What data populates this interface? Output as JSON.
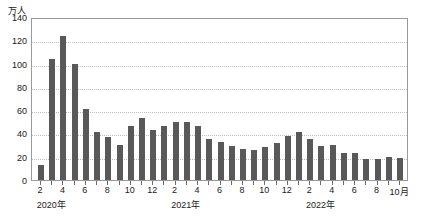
{
  "chart_data": {
    "type": "bar",
    "title": "",
    "subtitle": "",
    "unit_label": "万人",
    "xlabel": "",
    "ylabel": "",
    "ylim": [
      0,
      140
    ],
    "ytick_values": [
      0,
      20,
      40,
      60,
      80,
      100,
      120,
      140
    ],
    "ytick_labels": [
      "0",
      "20",
      "40",
      "60",
      "80",
      "100",
      "120",
      "140"
    ],
    "grid": true,
    "grid_axis": "y",
    "legend": false,
    "legend_position": "none",
    "bar_color": "#595959",
    "axis_color": "#9a9a9a",
    "grid_color": "#bdbdbd",
    "categories": [
      "2020-02",
      "2020-03",
      "2020-04",
      "2020-05",
      "2020-06",
      "2020-07",
      "2020-08",
      "2020-09",
      "2020-10",
      "2020-11",
      "2020-12",
      "2021-01",
      "2021-02",
      "2021-03",
      "2021-04",
      "2021-05",
      "2021-06",
      "2021-07",
      "2021-08",
      "2021-09",
      "2021-10",
      "2021-11",
      "2021-12",
      "2022-01",
      "2022-02",
      "2022-03",
      "2022-04",
      "2022-05",
      "2022-06",
      "2022-07",
      "2022-08",
      "2022-09",
      "2022-10"
    ],
    "values": [
      13,
      104,
      124,
      100,
      61,
      41,
      37,
      30,
      46,
      53,
      43,
      46,
      50,
      50,
      46,
      35,
      33,
      29,
      27,
      26,
      28,
      32,
      38,
      41,
      35,
      29,
      30,
      23,
      23,
      18,
      18,
      20,
      19
    ],
    "x_tick_labels": [
      {
        "index": 0,
        "label": "2"
      },
      {
        "index": 2,
        "label": "4"
      },
      {
        "index": 4,
        "label": "6"
      },
      {
        "index": 6,
        "label": "8"
      },
      {
        "index": 8,
        "label": "10"
      },
      {
        "index": 10,
        "label": "12"
      },
      {
        "index": 12,
        "label": "2"
      },
      {
        "index": 14,
        "label": "4"
      },
      {
        "index": 16,
        "label": "6"
      },
      {
        "index": 18,
        "label": "8"
      },
      {
        "index": 20,
        "label": "10"
      },
      {
        "index": 22,
        "label": "12"
      },
      {
        "index": 24,
        "label": "2"
      },
      {
        "index": 26,
        "label": "4"
      },
      {
        "index": 28,
        "label": "6"
      },
      {
        "index": 30,
        "label": "8"
      },
      {
        "index": 32,
        "label": "10月"
      }
    ],
    "year_labels": [
      {
        "index": 1,
        "label": "2020年"
      },
      {
        "index": 13,
        "label": "2021年"
      },
      {
        "index": 25,
        "label": "2022年"
      }
    ]
  }
}
